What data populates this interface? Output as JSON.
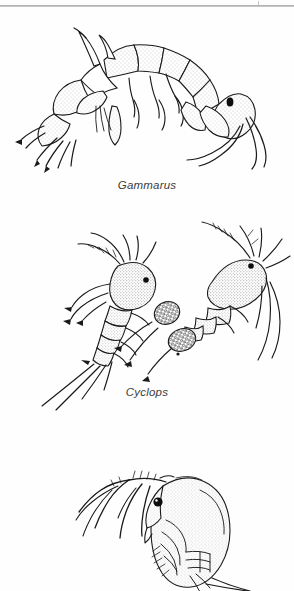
{
  "page": {
    "background_color": "#fefefe",
    "ink_color": "#1a1a1a",
    "caption_color": "#3c3c3c",
    "width": 294,
    "height": 591,
    "illustration_style": "stippled pen-and-ink scientific line drawing"
  },
  "artifacts": {
    "top_rule": "horizontal-scan-rule",
    "top_tick": "scan-tick-mark"
  },
  "figures": [
    {
      "id": "gammarus",
      "caption": "Gammarus",
      "common_name": "freshwater shrimp / scud",
      "group": "Amphipoda",
      "specimen_count": 1,
      "orientation": "lateral view, head to the right, body arched",
      "features": [
        "segmented arched thorax",
        "stippled shading",
        "black compound eye",
        "paired antennae",
        "multiple jointed pereopods",
        "uropods at rear"
      ]
    },
    {
      "id": "cyclops",
      "caption": "Cyclops",
      "common_name": "copepod",
      "group": "Copepoda",
      "specimen_count": 2,
      "orientation": "two individuals, left facing lower-left, right facing upper-right",
      "features": [
        "pear-shaped stippled cephalothorax",
        "single median black eye",
        "long branched first antennae",
        "segmented abdomen",
        "paired caudal setae",
        "two granular egg sacs on right specimen"
      ]
    },
    {
      "id": "daphnia",
      "caption": "",
      "common_name": "water flea",
      "group": "Cladocera",
      "specimen_count": 1,
      "orientation": "lateral view, head upper-left, carapace to the right",
      "features": [
        "rounded stippled carapace",
        "large black compound eye",
        "large branched swimming antennae",
        "thoracic limbs beneath carapace",
        "apical tail spine"
      ]
    }
  ]
}
